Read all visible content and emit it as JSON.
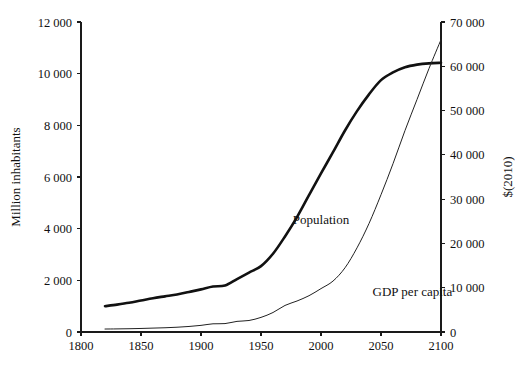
{
  "chart_data": {
    "type": "line",
    "title": "",
    "subtitle": "",
    "xlabel": "",
    "ylabel": "Million inhabitants",
    "y2label": "$(2010)",
    "xlim": [
      1800,
      2100
    ],
    "ylim": [
      0,
      12000
    ],
    "y2lim": [
      0,
      70000
    ],
    "grid": false,
    "legend_position": "inline-annotation",
    "x_ticks": [
      1800,
      1850,
      1900,
      1950,
      2000,
      2050,
      2100
    ],
    "x_tick_labels": [
      "1800",
      "1850",
      "1900",
      "1950",
      "2000",
      "2050",
      "2100"
    ],
    "y_ticks": [
      0,
      2000,
      4000,
      6000,
      8000,
      10000,
      12000
    ],
    "y_tick_labels": [
      "0",
      "2 000",
      "4 000",
      "6 000",
      "8 000",
      "10 000",
      "12 000"
    ],
    "y2_ticks": [
      0,
      10000,
      20000,
      30000,
      40000,
      50000,
      60000,
      70000
    ],
    "y2_tick_labels": [
      "0",
      "10 000",
      "20 000",
      "30 000",
      "40 000",
      "50 000",
      "60 000",
      "70 000"
    ],
    "series": [
      {
        "name": "Population",
        "axis": "left",
        "units": "million inhabitants",
        "color": "#111111",
        "label_x": 2000,
        "label_y": 4200,
        "x": [
          1820,
          1830,
          1840,
          1850,
          1860,
          1870,
          1880,
          1890,
          1900,
          1910,
          1920,
          1930,
          1940,
          1950,
          1960,
          1970,
          1980,
          1990,
          2000,
          2010,
          2020,
          2030,
          2040,
          2050,
          2060,
          2070,
          2080,
          2090,
          2100
        ],
        "values": [
          1000,
          1060,
          1130,
          1220,
          1310,
          1380,
          1450,
          1550,
          1650,
          1760,
          1800,
          2050,
          2300,
          2550,
          3030,
          3700,
          4450,
          5300,
          6140,
          6960,
          7800,
          8550,
          9200,
          9750,
          10050,
          10250,
          10350,
          10400,
          10420
        ]
      },
      {
        "name": "GDP per capita",
        "axis": "right",
        "units": "$(2010)",
        "color": "#222222",
        "label_x": 2043,
        "label_y": 8200,
        "x": [
          1820,
          1830,
          1840,
          1850,
          1860,
          1870,
          1880,
          1890,
          1900,
          1910,
          1920,
          1930,
          1940,
          1950,
          1960,
          1970,
          1980,
          1990,
          2000,
          2010,
          2020,
          2030,
          2040,
          2050,
          2060,
          2070,
          2080,
          2090,
          2100
        ],
        "values": [
          670,
          700,
          740,
          800,
          880,
          960,
          1080,
          1250,
          1500,
          1850,
          1900,
          2400,
          2600,
          3300,
          4400,
          6000,
          7000,
          8200,
          9800,
          11500,
          14500,
          19000,
          24500,
          31000,
          38000,
          45500,
          52500,
          59500,
          66000
        ]
      }
    ]
  }
}
